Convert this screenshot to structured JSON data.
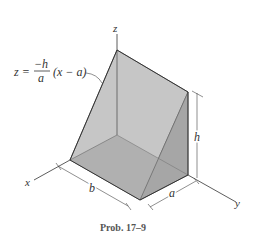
{
  "figure": {
    "caption": "Prob. 17–9",
    "equation": {
      "lhs": "z =",
      "numerator": "−h",
      "denominator": "a",
      "rhs": "(x − a)"
    },
    "axes": {
      "x": "x",
      "y": "y",
      "z": "z"
    },
    "dimensions": {
      "b": "b",
      "a": "a",
      "h": "h"
    },
    "colors": {
      "face_light": "#c4c4c4",
      "face_mid": "#b4b4b4",
      "face_dark": "#a2a2a2",
      "edge": "#444444"
    }
  }
}
